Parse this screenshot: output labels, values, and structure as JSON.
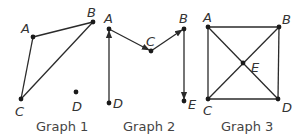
{
  "figure": {
    "graphs": [
      {
        "caption": "Graph 1",
        "directed": false,
        "vertices": {
          "A": {
            "label": "A",
            "x": 33,
            "y": 37
          },
          "B": {
            "label": "B",
            "x": 93,
            "y": 22
          },
          "C": {
            "label": "C",
            "x": 21,
            "y": 99
          },
          "D": {
            "label": "D",
            "x": 76,
            "y": 92
          }
        },
        "edges": [
          [
            "A",
            "B"
          ],
          [
            "A",
            "C"
          ],
          [
            "B",
            "C"
          ]
        ]
      },
      {
        "caption": "Graph 2",
        "directed": true,
        "vertices": {
          "A": {
            "label": "A",
            "x": 109,
            "y": 29
          },
          "B": {
            "label": "B",
            "x": 184,
            "y": 29
          },
          "C": {
            "label": "C",
            "x": 151,
            "y": 51
          },
          "D": {
            "label": "D",
            "x": 109,
            "y": 103
          },
          "E": {
            "label": "E",
            "x": 184,
            "y": 101
          }
        },
        "edges": [
          [
            "D",
            "A"
          ],
          [
            "A",
            "C"
          ],
          [
            "C",
            "B"
          ],
          [
            "B",
            "E"
          ]
        ]
      },
      {
        "caption": "Graph 3",
        "directed": false,
        "vertices": {
          "A": {
            "label": "A",
            "x": 208,
            "y": 27
          },
          "B": {
            "label": "B",
            "x": 279,
            "y": 27
          },
          "C": {
            "label": "C",
            "x": 208,
            "y": 99
          },
          "D": {
            "label": "D",
            "x": 278,
            "y": 99
          },
          "E": {
            "label": "E",
            "x": 243,
            "y": 63
          }
        },
        "edges": [
          [
            "A",
            "B"
          ],
          [
            "A",
            "C"
          ],
          [
            "B",
            "D"
          ],
          [
            "C",
            "D"
          ],
          [
            "A",
            "E"
          ],
          [
            "E",
            "D"
          ],
          [
            "B",
            "E"
          ],
          [
            "E",
            "C"
          ]
        ]
      }
    ],
    "colors": {
      "edge": "#2a2a2a",
      "node": "#1a1a1a",
      "text": "#333333"
    }
  }
}
